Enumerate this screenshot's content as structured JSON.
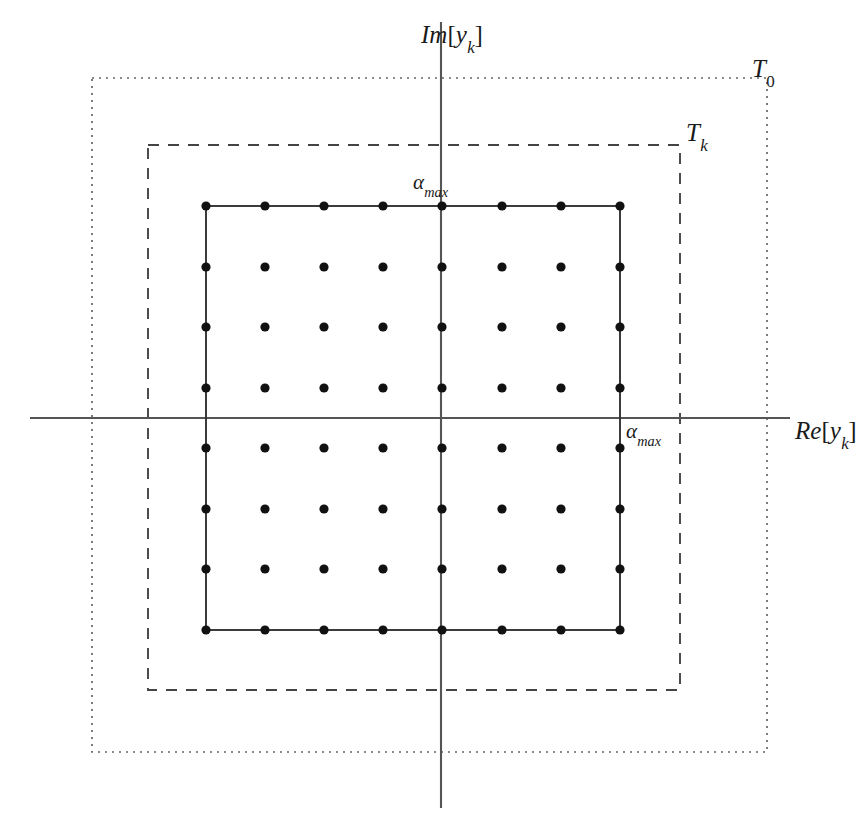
{
  "figure": {
    "width": 860,
    "height": 832,
    "background": "#ffffff"
  },
  "colors": {
    "axis": "#555555",
    "dot": "#111111",
    "solid_square": "#333333",
    "dashed_rect": "#444444",
    "dotted_rect": "#666666",
    "text": "#1a1a1a"
  },
  "axes": {
    "horizontal": {
      "name": "real-axis",
      "x1": 30,
      "y1": 418,
      "x2": 790,
      "y2": 418,
      "label_main": "Re",
      "label_bracket_open": "[",
      "label_var": "y",
      "label_sub": "k",
      "label_bracket_close": "]"
    },
    "vertical": {
      "name": "imaginary-axis",
      "x1": 441,
      "y1": 22,
      "x2": 441,
      "y2": 808,
      "label_main": "Im",
      "label_bracket_open": "[",
      "label_var": "y",
      "label_sub": "k",
      "label_bracket_close": "]"
    }
  },
  "regions": [
    {
      "id": "T0",
      "name": "outer-region-T0",
      "label_main": "T",
      "label_sub": "0",
      "stroke_style": "dotted",
      "x": 92,
      "y": 78,
      "width": 675,
      "height": 674,
      "dash_pattern": "2,5"
    },
    {
      "id": "Tk",
      "name": "middle-region-Tk",
      "label_main": "T",
      "label_sub": "k",
      "stroke_style": "dashed",
      "x": 148,
      "y": 145,
      "width": 532,
      "height": 545,
      "dash_pattern": "11,9"
    },
    {
      "id": "constellation-boundary",
      "name": "constellation-square",
      "label_main": "",
      "label_sub": "",
      "stroke_style": "solid",
      "x": 206,
      "y": 206,
      "width": 414,
      "height": 424,
      "dash_pattern": ""
    }
  ],
  "alpha_labels": [
    {
      "id": "alpha-max-imag",
      "symbol": "α",
      "subscript": "max",
      "x": 413,
      "y": 172,
      "marks": "vertical-extent-of-constellation"
    },
    {
      "id": "alpha-max-real",
      "symbol": "α",
      "subscript": "max",
      "x": 626,
      "y": 421,
      "marks": "horizontal-extent-of-constellation"
    }
  ],
  "chart_data": {
    "type": "scatter",
    "title": "",
    "xlabel": "Re[y_k]",
    "ylabel": "Im[y_k]",
    "grid": false,
    "legend": null,
    "marker": {
      "shape": "circle",
      "radius": 4.6,
      "color": "#111111",
      "filled": true
    },
    "lattice": {
      "rows": 8,
      "cols": 8,
      "x_start": 206,
      "y_start": 206,
      "x_step": 59.14,
      "y_step": 60.57,
      "total_points": 64
    },
    "x_pixels": [
      206,
      265,
      324,
      383,
      442,
      502,
      561,
      620
    ],
    "y_pixels": [
      206,
      267,
      327,
      388,
      448,
      509,
      569,
      630
    ],
    "x": [
      -3.5,
      -2.5,
      -1.5,
      -0.5,
      0.5,
      1.5,
      2.5,
      3.5
    ],
    "y": [
      3.5,
      2.5,
      1.5,
      0.5,
      -0.5,
      -1.5,
      -2.5,
      -3.5
    ],
    "xlim": [
      -4.2,
      4.2
    ],
    "ylim": [
      -4.2,
      4.2
    ],
    "annotations": [
      {
        "text": "T_0",
        "type": "region-label",
        "x": 752,
        "y": 56
      },
      {
        "text": "T_k",
        "type": "region-label",
        "x": 686,
        "y": 120
      },
      {
        "text": "alpha_max",
        "type": "extent-label",
        "x": 413,
        "y": 172
      },
      {
        "text": "alpha_max",
        "type": "extent-label",
        "x": 626,
        "y": 421
      }
    ]
  }
}
